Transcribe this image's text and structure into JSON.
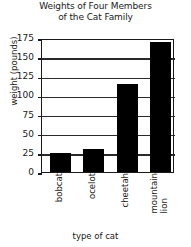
{
  "chart_data": {
    "type": "bar",
    "title": "Weights of Four Members of the Cat Family",
    "title_lines": [
      "Weights of Four Members",
      "of the Cat Family"
    ],
    "xlabel": "type of cat",
    "ylabel": "weight (pounds)",
    "categories": [
      "bobcat",
      "ocelot",
      "cheetah",
      "mountain lion"
    ],
    "category_lines": [
      [
        "bobcat"
      ],
      [
        "ocelot"
      ],
      [
        "cheetah"
      ],
      [
        "mountain",
        "lion"
      ]
    ],
    "values": [
      25,
      30,
      115,
      170
    ],
    "ylim": [
      0,
      175
    ],
    "yticks": [
      0,
      25,
      50,
      75,
      100,
      125,
      150,
      175
    ],
    "ytick_labels": [
      "0",
      "25",
      "50",
      "75",
      "100",
      "125",
      "150",
      "175"
    ],
    "grid": true,
    "legend": null,
    "bar_color": "#000000",
    "axis_color": "#1a1a1a",
    "background": "#ffffff"
  }
}
